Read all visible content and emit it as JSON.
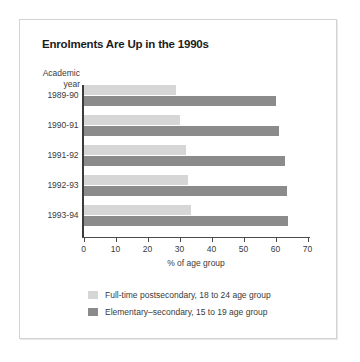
{
  "chart_data": {
    "type": "bar",
    "orientation": "horizontal",
    "title": "Enrolments Are Up in the 1990s",
    "categories": [
      "1989-90",
      "1990-91",
      "1991-92",
      "1992-93",
      "1993-94"
    ],
    "category_axis_label_line1": "Academic",
    "category_axis_label_line2": "year",
    "xlabel": "% of age group",
    "ylabel": "Academic year",
    "xlim": [
      0,
      70
    ],
    "xticks": [
      0,
      10,
      20,
      30,
      40,
      50,
      60,
      70
    ],
    "xtick_labels": [
      "0",
      "10",
      "20",
      "30",
      "40",
      "50",
      "60",
      "70"
    ],
    "grid": false,
    "legend_position": "bottom",
    "series": [
      {
        "name": "Full-time postsecondary, 18 to 24 age group",
        "color": "#d6d6d6",
        "values": [
          29,
          30,
          32,
          32.5,
          33.5
        ]
      },
      {
        "name": "Elementary–secondary, 15 to 19 age group",
        "color": "#8b8b8b",
        "values": [
          60,
          61,
          63,
          63.5,
          64
        ]
      }
    ]
  },
  "colors": {
    "light_series": "#d6d6d6",
    "dark_series": "#8b8b8b",
    "panel_border": "#d3d3d3",
    "axis": "#3c3c3c",
    "text": "#3a3a3a",
    "title": "#1c1c1c",
    "background": "#ffffff"
  }
}
